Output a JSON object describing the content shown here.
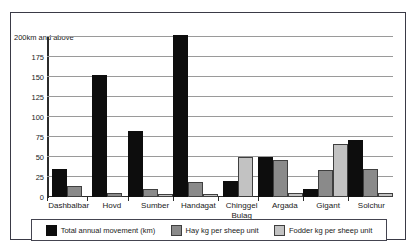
{
  "chart_data": {
    "type": "bar",
    "title": "",
    "xlabel": "",
    "ylabel": "",
    "ylim": [
      0,
      200
    ],
    "grid": true,
    "legend_position": "bottom",
    "categories": [
      "Dashbalbar",
      "Hovd",
      "Sumber",
      "Handagat",
      "Chinggel Bulag",
      "Argada",
      "Gigant",
      "Solchur"
    ],
    "y_ticks": [
      0,
      25,
      50,
      75,
      100,
      125,
      150,
      175,
      200
    ],
    "y_tick_labels": [
      "0",
      "25",
      "50",
      "75",
      "100",
      "125",
      "150",
      "175",
      "200km and above"
    ],
    "series": [
      {
        "name": "Total annual movement (km)",
        "color": "#0d0d0d",
        "values": [
          33,
          150,
          80,
          200,
          18,
          48,
          7,
          69
        ]
      },
      {
        "name": "Hay kg per sheep unit",
        "color": "#8a8a8a",
        "values": [
          11,
          3,
          7,
          16,
          0,
          44,
          31,
          32
        ]
      },
      {
        "name": "Fodder kg per sheep unit",
        "color": "#c2c2c2",
        "values": [
          0,
          0,
          1,
          1,
          47,
          2,
          64,
          3
        ]
      }
    ]
  },
  "legend": {
    "items": [
      "Total annual movement (km)",
      "Hay kg per sheep unit",
      "Fodder kg per sheep unit"
    ]
  }
}
